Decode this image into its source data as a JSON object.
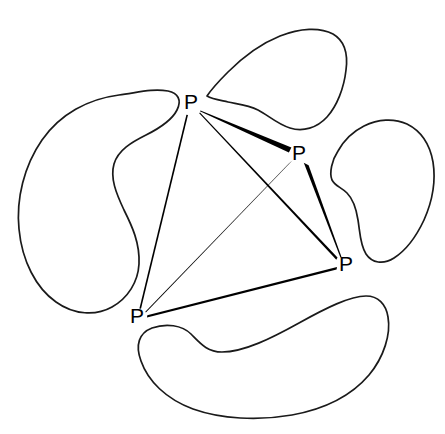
{
  "figure": {
    "background_color": "#ffffff",
    "stroke_color": "#1a1a1a",
    "edge_color": "#000000",
    "label_color": "#000000",
    "width": 445,
    "height": 434
  },
  "diagram_data": {
    "type": "node-link-diagram",
    "node_label_text": "P",
    "node_count": 4,
    "edge_count": 6,
    "region_count": 4,
    "nodes": [
      {
        "id": "P1",
        "label": "P",
        "x": 191,
        "y": 103,
        "position_name": "top-left-node"
      },
      {
        "id": "P2",
        "label": "P",
        "x": 299,
        "y": 154,
        "position_name": "upper-right-node"
      },
      {
        "id": "P3",
        "label": "P",
        "x": 346,
        "y": 265,
        "position_name": "lower-right-node"
      },
      {
        "id": "P4",
        "label": "P",
        "x": 137,
        "y": 317,
        "position_name": "bottom-left-node"
      }
    ],
    "edges": [
      {
        "id": "E1",
        "from": "P1",
        "to": "P2",
        "width_at_from": 0.8,
        "width_at_to": 5.2,
        "style": "tapered"
      },
      {
        "id": "E2",
        "from": "P1",
        "to": "P3",
        "width_at_from": 0.9,
        "width_at_to": 2.2,
        "style": "tapered"
      },
      {
        "id": "E3",
        "from": "P1",
        "to": "P4",
        "width_at_from": 1.5,
        "width_at_to": 1.5,
        "style": "uniform"
      },
      {
        "id": "E4",
        "from": "P2",
        "to": "P3",
        "width_at_from": 5.0,
        "width_at_to": 1.0,
        "style": "tapered"
      },
      {
        "id": "E5",
        "from": "P2",
        "to": "P4",
        "width_at_from": 5.4,
        "width_at_to": 0.7,
        "style": "tapered"
      },
      {
        "id": "E6",
        "from": "P3",
        "to": "P4",
        "width_at_from": 2.6,
        "width_at_to": 2.6,
        "style": "uniform"
      }
    ],
    "regions": [
      {
        "id": "R1",
        "name": "left-region-blob",
        "shape": "kidney",
        "centroid_x": 100,
        "centroid_y": 200
      },
      {
        "id": "R2",
        "name": "top-region-blob",
        "shape": "rounded-lobe",
        "centroid_x": 275,
        "centroid_y": 70
      },
      {
        "id": "R3",
        "name": "right-region-blob",
        "shape": "kidney",
        "centroid_x": 385,
        "centroid_y": 195
      },
      {
        "id": "R4",
        "name": "bottom-region-blob",
        "shape": "crescent",
        "centroid_x": 255,
        "centroid_y": 360
      }
    ]
  }
}
